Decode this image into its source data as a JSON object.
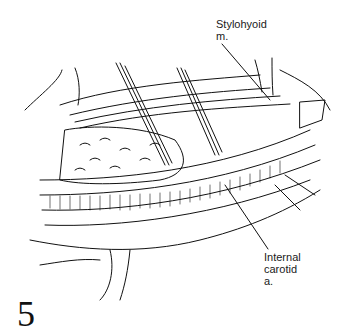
{
  "figure": {
    "number": "5",
    "labels": {
      "stylohyoid": "Stylohyoid\nm.",
      "internal_carotid": "Internal\ncarotid\na."
    }
  }
}
